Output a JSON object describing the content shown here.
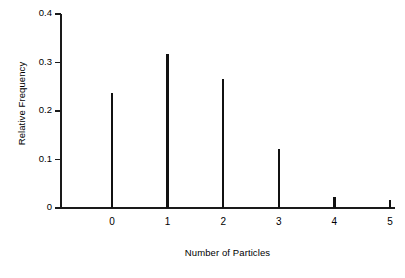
{
  "chart_data": {
    "type": "bar",
    "title": "",
    "subtitle": "",
    "xlabel": "Number of Particles",
    "ylabel": "Relative Frequency",
    "categories": [
      "0",
      "1",
      "2",
      "3",
      "4",
      "5"
    ],
    "values": [
      0.237,
      0.318,
      0.265,
      0.122,
      0.023,
      0.016
    ],
    "series": [
      {
        "name": "Relative Frequency",
        "values": [
          0.237,
          0.318,
          0.265,
          0.122,
          0.023,
          0.016
        ]
      }
    ],
    "xlim": [
      -0.5,
      5.35
    ],
    "ylim": [
      0,
      0.4
    ],
    "ytick_labels": [
      "0.4",
      "0.3",
      "0.2",
      "0.1",
      "0"
    ],
    "ytick_values": [
      0.4,
      0.3,
      0.2,
      0.1,
      0
    ],
    "xtick_labels": [
      "0",
      "1",
      "2",
      "3",
      "4",
      "5"
    ],
    "grid": false,
    "legend": false,
    "legend_position": "none",
    "bar_color": "#111111",
    "axis_color": "#1a1a1a",
    "background_color": "#ffffff",
    "style": "needle-spike"
  }
}
